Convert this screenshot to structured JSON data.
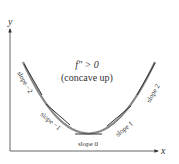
{
  "figure": {
    "axes": {
      "x_label": "x",
      "y_label": "y"
    },
    "annotation": {
      "line1": "f″ > 0",
      "line2": "(concave up)"
    },
    "tangent_labels": [
      {
        "label": "slope −2"
      },
      {
        "label": "slope −1"
      },
      {
        "label": "slope 0"
      },
      {
        "label": "slope 1"
      },
      {
        "label": "slope 2"
      }
    ],
    "colors": {
      "curve": "#7a7a7a",
      "tangent": "#3a3a3a",
      "axis": "#555555",
      "text": "#333333"
    }
  }
}
